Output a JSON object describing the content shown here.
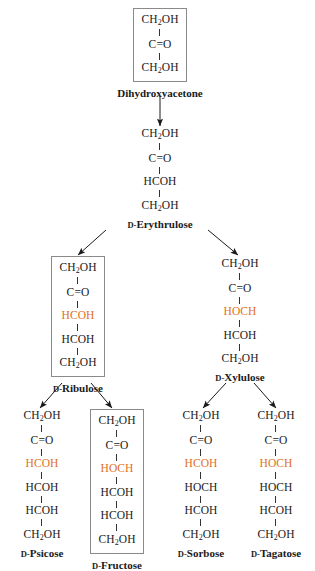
{
  "diagram": {
    "accent_color": "#e1701e",
    "box_color": "#8a8a8a",
    "background": "#ffffff",
    "d_prefix": "D-"
  },
  "nodes": {
    "dihydroxyacetone": {
      "name": "Dihydroxyacetone",
      "label_prefix": "",
      "label_main": "Dihydroxyacetone",
      "boxed": true,
      "groups": [
        {
          "text": "CH2OH",
          "highlight": false
        },
        {
          "text": "C=O",
          "highlight": false
        },
        {
          "text": "CH2OH",
          "highlight": false
        }
      ]
    },
    "erythrulose": {
      "name": "D-Erythrulose",
      "label_prefix": "D-",
      "label_main": "Erythrulose",
      "boxed": false,
      "groups": [
        {
          "text": "CH2OH",
          "highlight": false
        },
        {
          "text": "C=O",
          "highlight": false
        },
        {
          "text": "HCOH",
          "highlight": false
        },
        {
          "text": "CH2OH",
          "highlight": false
        }
      ]
    },
    "ribulose": {
      "name": "D-Ribulose",
      "label_prefix": "D-",
      "label_main": "Ribulose",
      "boxed": true,
      "groups": [
        {
          "text": "CH2OH",
          "highlight": false
        },
        {
          "text": "C=O",
          "highlight": false
        },
        {
          "text": "HCOH",
          "highlight": true
        },
        {
          "text": "HCOH",
          "highlight": false
        },
        {
          "text": "CH2OH",
          "highlight": false
        }
      ]
    },
    "xylulose": {
      "name": "D-Xylulose",
      "label_prefix": "D-",
      "label_main": "Xylulose",
      "boxed": false,
      "groups": [
        {
          "text": "CH2OH",
          "highlight": false
        },
        {
          "text": "C=O",
          "highlight": false
        },
        {
          "text": "HOCH",
          "highlight": true
        },
        {
          "text": "HCOH",
          "highlight": false
        },
        {
          "text": "CH2OH",
          "highlight": false
        }
      ]
    },
    "psicose": {
      "name": "D-Psicose",
      "label_prefix": "D-",
      "label_main": "Psicose",
      "boxed": false,
      "groups": [
        {
          "text": "CH2OH",
          "highlight": false
        },
        {
          "text": "C=O",
          "highlight": false
        },
        {
          "text": "HCOH",
          "highlight": true
        },
        {
          "text": "HCOH",
          "highlight": false
        },
        {
          "text": "HCOH",
          "highlight": false
        },
        {
          "text": "CH2OH",
          "highlight": false
        }
      ]
    },
    "fructose": {
      "name": "D-Fructose",
      "label_prefix": "D-",
      "label_main": "Fructose",
      "boxed": true,
      "groups": [
        {
          "text": "CH2OH",
          "highlight": false
        },
        {
          "text": "C=O",
          "highlight": false
        },
        {
          "text": "HOCH",
          "highlight": true
        },
        {
          "text": "HCOH",
          "highlight": false
        },
        {
          "text": "HCOH",
          "highlight": false
        },
        {
          "text": "CH2OH",
          "highlight": false
        }
      ]
    },
    "sorbose": {
      "name": "D-Sorbose",
      "label_prefix": "D-",
      "label_main": "Sorbose",
      "boxed": false,
      "groups": [
        {
          "text": "CH2OH",
          "highlight": false
        },
        {
          "text": "C=O",
          "highlight": false
        },
        {
          "text": "HCOH",
          "highlight": true
        },
        {
          "text": "HOCH",
          "highlight": false
        },
        {
          "text": "HCOH",
          "highlight": false
        },
        {
          "text": "CH2OH",
          "highlight": false
        }
      ]
    },
    "tagatose": {
      "name": "D-Tagatose",
      "label_prefix": "D-",
      "label_main": "Tagatose",
      "boxed": false,
      "groups": [
        {
          "text": "CH2OH",
          "highlight": false
        },
        {
          "text": "C=O",
          "highlight": false
        },
        {
          "text": "HOCH",
          "highlight": true
        },
        {
          "text": "HOCH",
          "highlight": false
        },
        {
          "text": "HCOH",
          "highlight": false
        },
        {
          "text": "CH2OH",
          "highlight": false
        }
      ]
    }
  },
  "edges": [
    {
      "from": "dihydroxyacetone",
      "to": "erythrulose"
    },
    {
      "from": "erythrulose",
      "to": "ribulose"
    },
    {
      "from": "erythrulose",
      "to": "xylulose"
    },
    {
      "from": "ribulose",
      "to": "psicose"
    },
    {
      "from": "ribulose",
      "to": "fructose"
    },
    {
      "from": "xylulose",
      "to": "sorbose"
    },
    {
      "from": "xylulose",
      "to": "tagatose"
    }
  ]
}
